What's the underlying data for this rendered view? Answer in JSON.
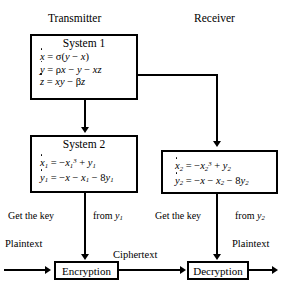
{
  "diagram": {
    "headers": {
      "transmitter": "Transmitter",
      "receiver": "Receiver"
    },
    "system1": {
      "title": "System 1",
      "equations": [
        "ẋ = σ(y − x)",
        "ẏ = ρx − y − xz",
        "ż = xy − βz"
      ]
    },
    "system2": {
      "title": "System 2",
      "equations": [
        "ẋ₁ = −x₁³ + y₁",
        "ẏ₁ = −x − x₁ − 8y₁"
      ]
    },
    "receiver_system": {
      "title": "",
      "equations": [
        "ẋ₂ = −x₂³ + y₂",
        "ẏ₂ = −x − x₂ − 8y₂"
      ]
    },
    "key_left": {
      "prefix": "Get the key",
      "suffix": "from y₁"
    },
    "key_right": {
      "prefix": "Get the key",
      "suffix": "from y₂"
    },
    "flow": {
      "plaintext_in": "Plaintext",
      "ciphertext": "Ciphertext",
      "plaintext_out": "Plaintext",
      "encryption": "Encryption",
      "decryption": "Decryption"
    },
    "colors": {
      "stroke": "#000000",
      "background": "#ffffff"
    }
  }
}
